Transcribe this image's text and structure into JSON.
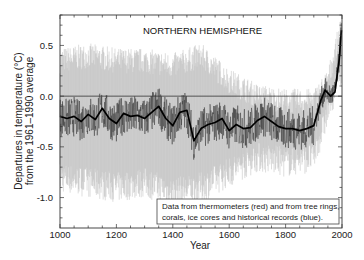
{
  "chart_data": {
    "type": "line",
    "title": "NORTHERN HEMISPHERE",
    "xlabel": "Year",
    "ylabel_line1": "Departures in temperature (°C)",
    "ylabel_line2": "from the 1961–1990 average",
    "xlim": [
      1000,
      2000
    ],
    "ylim": [
      -1.3,
      0.8
    ],
    "x_ticks": [
      1000,
      1200,
      1400,
      1600,
      1800,
      2000
    ],
    "x_tick_labels": [
      "1000",
      "1200",
      "1400",
      "1600",
      "1800",
      "2000"
    ],
    "y_ticks": [
      0.5,
      0.0,
      -0.5,
      -1.0
    ],
    "y_tick_labels": [
      "0.5",
      "0.0",
      "-0.5",
      "-1.0"
    ],
    "reference_line": 0.0,
    "grid": false,
    "legend_position": "lower right",
    "annotation_line1": "Data from thermometers (red) and from tree rings,",
    "annotation_line2": "corals, ice cores and historical records (blue).",
    "colors": {
      "uncertainty_band": "#bdbdbd",
      "annual_series": "#3a3a3a",
      "smoothed_series": "#000000"
    },
    "series": [
      {
        "name": "Smoothed (50-yr) reconstruction",
        "x": [
          1000,
          1025,
          1050,
          1075,
          1100,
          1125,
          1150,
          1175,
          1200,
          1225,
          1250,
          1275,
          1300,
          1325,
          1350,
          1375,
          1400,
          1425,
          1450,
          1475,
          1500,
          1525,
          1550,
          1575,
          1600,
          1625,
          1650,
          1675,
          1700,
          1725,
          1750,
          1775,
          1800,
          1825,
          1850,
          1875,
          1900,
          1925,
          1940,
          1960,
          1975,
          1990,
          1998
        ],
        "values": [
          -0.2,
          -0.22,
          -0.2,
          -0.25,
          -0.18,
          -0.23,
          -0.12,
          -0.22,
          -0.27,
          -0.17,
          -0.2,
          -0.19,
          -0.22,
          -0.16,
          -0.1,
          -0.22,
          -0.29,
          -0.16,
          -0.14,
          -0.44,
          -0.32,
          -0.28,
          -0.26,
          -0.22,
          -0.34,
          -0.28,
          -0.32,
          -0.31,
          -0.24,
          -0.2,
          -0.25,
          -0.3,
          -0.32,
          -0.32,
          -0.34,
          -0.32,
          -0.29,
          -0.04,
          0.06,
          0.0,
          0.04,
          0.36,
          0.65
        ]
      },
      {
        "name": "Uncertainty range (upper)",
        "x": [
          1000,
          1100,
          1200,
          1300,
          1400,
          1500,
          1600,
          1700,
          1800,
          1900,
          1950,
          2000
        ],
        "values": [
          0.35,
          0.4,
          0.35,
          0.35,
          0.3,
          0.4,
          0.15,
          0.0,
          -0.05,
          -0.05,
          0.15,
          0.7
        ]
      },
      {
        "name": "Uncertainty range (lower)",
        "x": [
          1000,
          1100,
          1200,
          1300,
          1400,
          1500,
          1600,
          1700,
          1800,
          1900,
          1950,
          2000
        ],
        "values": [
          -0.8,
          -0.85,
          -0.9,
          -0.85,
          -0.95,
          -0.9,
          -0.75,
          -0.6,
          -0.65,
          -0.6,
          -0.15,
          0.3
        ]
      }
    ]
  }
}
